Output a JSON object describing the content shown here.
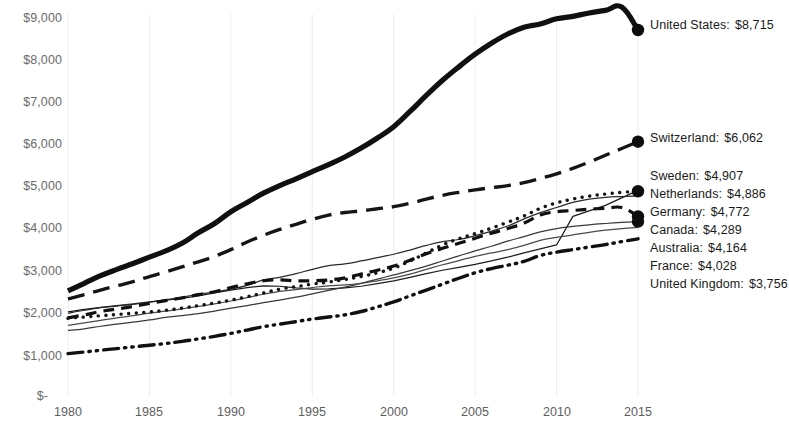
{
  "chart_data": {
    "type": "line",
    "title": "",
    "subtitle": "",
    "xlabel": "",
    "ylabel": "",
    "xlim": [
      1980,
      2015
    ],
    "ylim": [
      0,
      9000
    ],
    "grid": "faint-vertical",
    "legend_position": "right-inline-endpoint-labels",
    "currency_prefix": "$",
    "x_ticks": [
      1980,
      1985,
      1990,
      1995,
      2000,
      2005,
      2010,
      2015
    ],
    "x_tick_labels": [
      "1980",
      "1985",
      "1990",
      "1995",
      "2000",
      "2005",
      "2010",
      "2015"
    ],
    "y_ticks": [
      0,
      1000,
      2000,
      3000,
      4000,
      5000,
      6000,
      7000,
      8000,
      9000
    ],
    "y_tick_labels": [
      "$-",
      "$1,000",
      "$2,000",
      "$3,000",
      "$4,000",
      "$5,000",
      "$6,000",
      "$7,000",
      "$8,000",
      "$9,000"
    ],
    "x": [
      1980,
      1981,
      1982,
      1983,
      1984,
      1985,
      1986,
      1987,
      1988,
      1989,
      1990,
      1991,
      1992,
      1993,
      1994,
      1995,
      1996,
      1997,
      1998,
      1999,
      2000,
      2001,
      2002,
      2003,
      2004,
      2005,
      2006,
      2007,
      2008,
      2009,
      2010,
      2011,
      2012,
      2013,
      2014,
      2015
    ],
    "series": [
      {
        "name": "United States",
        "end_label": "United States:",
        "end_value": 8715,
        "end_value_text": "$8,715",
        "style": "solid-thick",
        "color": "#101010",
        "values": [
          2520,
          2700,
          2880,
          3030,
          3170,
          3320,
          3470,
          3650,
          3900,
          4120,
          4400,
          4620,
          4840,
          5020,
          5180,
          5350,
          5520,
          5700,
          5910,
          6150,
          6420,
          6780,
          7160,
          7520,
          7840,
          8140,
          8400,
          8620,
          8780,
          8860,
          8980,
          9040,
          9120,
          9180,
          9260,
          8715
        ]
      },
      {
        "name": "Switzerland",
        "end_label": "Switzerland:",
        "end_value": 6062,
        "end_value_text": "$6,062",
        "style": "long-dash",
        "color": "#151515",
        "values": [
          2330,
          2430,
          2540,
          2640,
          2740,
          2860,
          2970,
          3090,
          3210,
          3340,
          3500,
          3680,
          3840,
          3980,
          4100,
          4220,
          4320,
          4380,
          4420,
          4470,
          4520,
          4600,
          4700,
          4790,
          4860,
          4920,
          4970,
          5020,
          5090,
          5190,
          5300,
          5430,
          5580,
          5740,
          5900,
          6062
        ]
      },
      {
        "name": "Sweden",
        "end_label": "Sweden:",
        "end_value": 4907,
        "end_value_text": "$4,907",
        "style": "solid-thin",
        "color": "#1c1c1c",
        "values": [
          2020,
          2080,
          2130,
          2170,
          2210,
          2260,
          2300,
          2340,
          2400,
          2470,
          2540,
          2600,
          2640,
          2630,
          2590,
          2560,
          2570,
          2590,
          2630,
          2690,
          2760,
          2840,
          2930,
          3010,
          3080,
          3150,
          3230,
          3320,
          3420,
          3520,
          3610,
          4290,
          4420,
          4550,
          4730,
          4907
        ]
      },
      {
        "name": "Netherlands",
        "end_label": "Netherlands:",
        "end_value": 4886,
        "end_value_text": "$4,886",
        "style": "dotted",
        "color": "#151515",
        "values": [
          1870,
          1900,
          1930,
          1960,
          1990,
          2020,
          2060,
          2110,
          2170,
          2230,
          2300,
          2380,
          2470,
          2560,
          2620,
          2680,
          2730,
          2790,
          2860,
          2950,
          3060,
          3230,
          3420,
          3610,
          3760,
          3880,
          4010,
          4150,
          4300,
          4480,
          4610,
          4700,
          4770,
          4820,
          4860,
          4886
        ]
      },
      {
        "name": "Germany",
        "end_label": "Germany:",
        "end_value": 4772,
        "end_value_text": "$4,772",
        "style": "solid-thin",
        "color": "#2a2a2a",
        "values": [
          1990,
          2060,
          2120,
          2160,
          2200,
          2250,
          2310,
          2370,
          2440,
          2490,
          2560,
          2650,
          2780,
          2840,
          2930,
          3030,
          3120,
          3160,
          3230,
          3310,
          3390,
          3490,
          3600,
          3690,
          3740,
          3830,
          3940,
          4060,
          4230,
          4380,
          4500,
          4620,
          4700,
          4740,
          4760,
          4772
        ]
      },
      {
        "name": "Canada",
        "end_label": "Canada:",
        "end_value": 4289,
        "end_value_text": "$4,289",
        "style": "medium-dash",
        "color": "#101010",
        "values": [
          1880,
          1950,
          2030,
          2090,
          2150,
          2220,
          2290,
          2350,
          2430,
          2500,
          2600,
          2690,
          2760,
          2780,
          2760,
          2760,
          2780,
          2830,
          2920,
          3010,
          3110,
          3250,
          3400,
          3530,
          3650,
          3770,
          3890,
          4000,
          4130,
          4320,
          4400,
          4430,
          4460,
          4480,
          4500,
          4289
        ]
      },
      {
        "name": "Australia",
        "end_label": "Australia:",
        "end_value": 4164,
        "end_value_text": "$4,164",
        "style": "solid-thin",
        "color": "#3a3a3a",
        "values": [
          1580,
          1620,
          1680,
          1730,
          1780,
          1830,
          1890,
          1930,
          1980,
          2040,
          2110,
          2170,
          2240,
          2300,
          2370,
          2450,
          2530,
          2610,
          2700,
          2800,
          2900,
          3000,
          3110,
          3230,
          3350,
          3470,
          3580,
          3700,
          3810,
          3920,
          4000,
          4050,
          4090,
          4120,
          4145,
          4164
        ]
      },
      {
        "name": "France",
        "end_label": "France:",
        "end_value": 4028,
        "end_value_text": "$4,028",
        "style": "solid-thin",
        "color": "#4a4a4a",
        "values": [
          1700,
          1760,
          1820,
          1880,
          1930,
          1990,
          2040,
          2090,
          2150,
          2210,
          2280,
          2360,
          2440,
          2510,
          2550,
          2600,
          2640,
          2660,
          2700,
          2760,
          2830,
          2920,
          3030,
          3140,
          3240,
          3340,
          3420,
          3500,
          3600,
          3720,
          3790,
          3850,
          3910,
          3960,
          4000,
          4028
        ]
      },
      {
        "name": "United Kingdom",
        "end_label": "United Kingdom:",
        "end_value": 3756,
        "end_value_text": "$3,756",
        "style": "dash-dot-dot",
        "color": "#101010",
        "values": [
          1030,
          1070,
          1110,
          1150,
          1190,
          1230,
          1270,
          1320,
          1380,
          1440,
          1510,
          1590,
          1670,
          1730,
          1790,
          1850,
          1900,
          1950,
          2030,
          2140,
          2260,
          2400,
          2540,
          2680,
          2820,
          2950,
          3050,
          3130,
          3220,
          3360,
          3440,
          3500,
          3560,
          3620,
          3690,
          3756
        ]
      }
    ],
    "endpoint_markers": [
      {
        "series": "United States",
        "shown": true
      },
      {
        "series": "Switzerland",
        "shown": true
      },
      {
        "series": "Netherlands",
        "shown": true
      },
      {
        "series": "Canada",
        "shown": true
      },
      {
        "series": "Australia",
        "shown": true
      }
    ]
  }
}
